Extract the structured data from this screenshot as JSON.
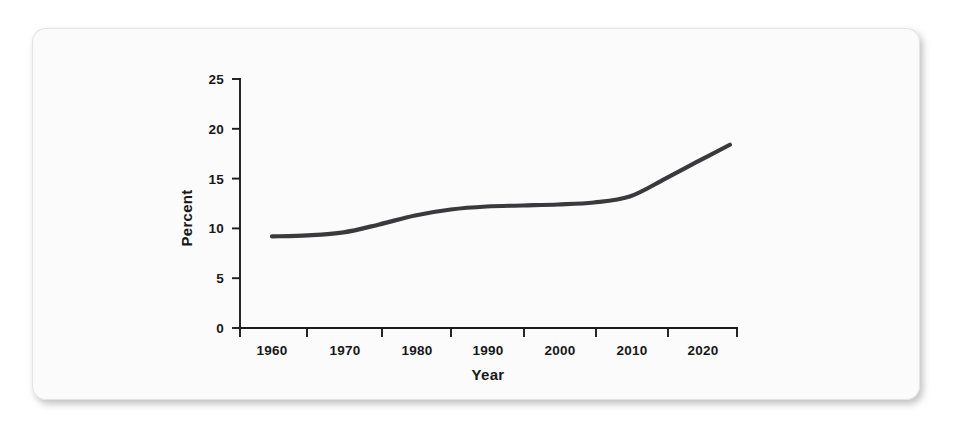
{
  "figure": {
    "card_background": "#fbfbfb",
    "page_background": "#ffffff"
  },
  "chart_data": {
    "type": "line",
    "title": "",
    "xlabel": "Year",
    "ylabel": "Percent",
    "xlim": [
      1960,
      2025
    ],
    "ylim": [
      0,
      25
    ],
    "grid": false,
    "legend": false,
    "line_color": "#3a3a3c",
    "x_tick_labels": [
      "1960",
      "1970",
      "1980",
      "1990",
      "2000",
      "2010",
      "2020"
    ],
    "x_ticks": [
      1960,
      1970,
      1980,
      1990,
      2000,
      2010,
      2020
    ],
    "y_tick_labels": [
      "0",
      "5",
      "10",
      "15",
      "20",
      "25"
    ],
    "y_ticks": [
      0,
      5,
      10,
      15,
      20,
      25
    ],
    "x": [
      1960,
      1965,
      1970,
      1975,
      1980,
      1985,
      1990,
      1995,
      2000,
      2005,
      2010,
      2015,
      2020,
      2024
    ],
    "values": [
      9.2,
      9.3,
      9.6,
      10.4,
      11.3,
      11.9,
      12.2,
      12.3,
      12.4,
      12.6,
      13.2,
      15.0,
      16.9,
      18.4
    ],
    "series": [
      {
        "name": "Percent",
        "values": [
          9.2,
          9.3,
          9.6,
          10.4,
          11.3,
          11.9,
          12.2,
          12.3,
          12.4,
          12.6,
          13.2,
          15.0,
          16.9,
          18.4
        ]
      }
    ]
  }
}
